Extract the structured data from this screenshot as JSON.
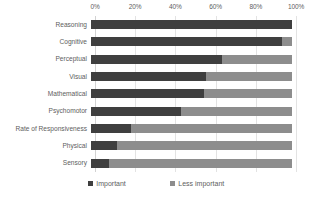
{
  "chart_data": {
    "type": "bar",
    "subtype": "stacked-horizontal-100",
    "title": "",
    "xlabel": "",
    "ylabel": "",
    "xlim": [
      0,
      100
    ],
    "x_ticks": [
      "0%",
      "20%",
      "40%",
      "60%",
      "80%",
      "100%"
    ],
    "x_tick_values": [
      0,
      20,
      40,
      60,
      80,
      100
    ],
    "grid": true,
    "legend_position": "bottom",
    "categories": [
      "Reasoning",
      "Cognitive",
      "Perceptual",
      "Visual",
      "Mathematical",
      "Psychomotor",
      "Rate of Responsiveness",
      "Physical",
      "Sensory"
    ],
    "series": [
      {
        "name": "Important",
        "color": "#3f3f3f",
        "values": [
          100,
          95,
          65,
          57,
          56,
          45,
          20,
          13,
          9
        ]
      },
      {
        "name": "Less important",
        "color": "#8d8d8d",
        "values": [
          0,
          5,
          35,
          43,
          44,
          55,
          80,
          87,
          91
        ]
      }
    ]
  },
  "legend": {
    "items": [
      {
        "label": "Important",
        "swatch_class": "important"
      },
      {
        "label": "Less important",
        "swatch_class": "less"
      }
    ]
  },
  "colors": {
    "important": "#3f3f3f",
    "less_important": "#8d8d8d",
    "gridline": "#e3e3e3",
    "text": "#5e5e5e",
    "background": "#ffffff"
  }
}
